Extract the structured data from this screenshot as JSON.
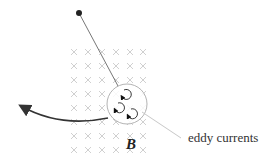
{
  "diagram": {
    "field_label": "B",
    "field_direction": "into page (crosses)",
    "callout_label": "eddy currents",
    "pivot": "pivot-dot",
    "elements": [
      "pendulum-rod",
      "metal-plate",
      "eddy-loops",
      "swing-arrow",
      "magnetic-field-grid"
    ],
    "colors": {
      "rod": "#777777",
      "arrow": "#333333",
      "field": "#c4c4c4",
      "plate": "#aaaaaa"
    }
  }
}
